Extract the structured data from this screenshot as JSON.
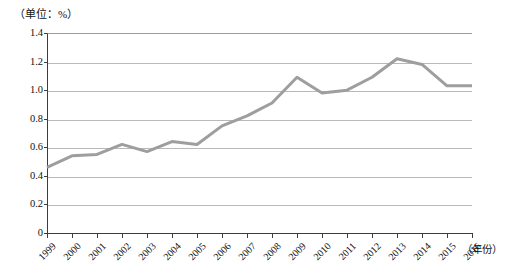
{
  "figure": {
    "unit_label": "（单位：%）",
    "xaxis_title": "（年份）"
  },
  "chart_data": {
    "type": "line",
    "title": "",
    "subtitle": "",
    "xlabel": "（年份）",
    "ylabel": "（单位：%）",
    "unit": "%",
    "grid": true,
    "legend": "none",
    "xlim": [
      "1999",
      "2016"
    ],
    "ylim": [
      0,
      1.4
    ],
    "yticks": [
      "0",
      "0.2",
      "0.4",
      "0.6",
      "0.8",
      "1.0",
      "1.2",
      "1.4"
    ],
    "ytick_values": [
      0,
      0.2,
      0.4,
      0.6,
      0.8,
      1.0,
      1.2,
      1.4
    ],
    "categories": [
      "1999",
      "2000",
      "2001",
      "2002",
      "2003",
      "2004",
      "2005",
      "2006",
      "2007",
      "2008",
      "2009",
      "2010",
      "2011",
      "2012",
      "2013",
      "2014",
      "2015",
      "2016"
    ],
    "values": [
      0.46,
      0.54,
      0.55,
      0.62,
      0.57,
      0.64,
      0.62,
      0.75,
      0.82,
      0.91,
      1.09,
      0.98,
      1.0,
      1.09,
      1.22,
      1.18,
      1.03,
      1.03
    ],
    "series": [
      {
        "name": "比重",
        "color": "#9b9b9b",
        "values": [
          0.46,
          0.54,
          0.55,
          0.62,
          0.57,
          0.64,
          0.62,
          0.75,
          0.82,
          0.91,
          1.09,
          0.98,
          1.0,
          1.09,
          1.22,
          1.18,
          1.03,
          1.03
        ]
      }
    ],
    "line_color": "#9e9e9e",
    "line_width": 3
  }
}
